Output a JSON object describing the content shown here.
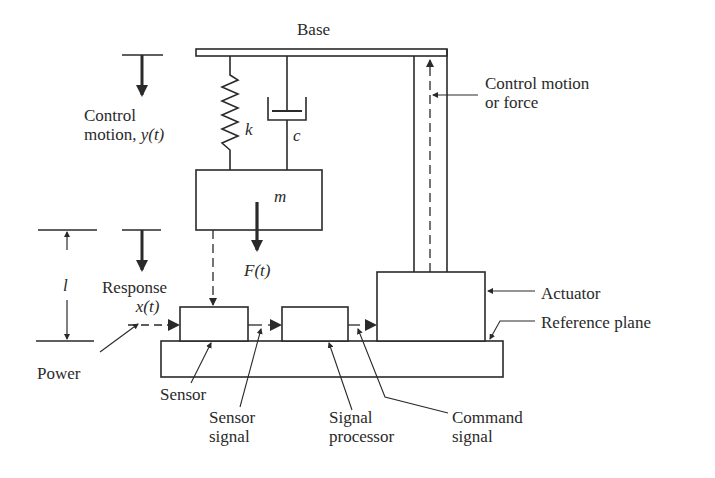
{
  "figure": {
    "labels": {
      "base": "Base",
      "control_motion_line1": "Control",
      "control_motion_line2": "motion, ",
      "control_motion_var": "y(t)",
      "spring": "k",
      "damper": "c",
      "mass": "m",
      "force": "F(t)",
      "length": "l",
      "response_line1": "Response",
      "response_var": "x(t)",
      "power": "Power",
      "sensor": "Sensor",
      "sensor_signal_line1": "Sensor",
      "sensor_signal_line2": "signal",
      "signal_processor_line1": "Signal",
      "signal_processor_line2": "processor",
      "command_signal_line1": "Command",
      "command_signal_line2": "signal",
      "actuator": "Actuator",
      "reference_plane": "Reference plane",
      "control_force_line1": "Control motion",
      "control_force_line2": "or force"
    },
    "components": [
      "Base",
      "Spring k",
      "Damper c",
      "Mass m",
      "Sensor",
      "Signal processor",
      "Actuator",
      "Reference plane"
    ],
    "colors": {
      "ink": "#2a2a2a",
      "background": "#ffffff"
    }
  }
}
